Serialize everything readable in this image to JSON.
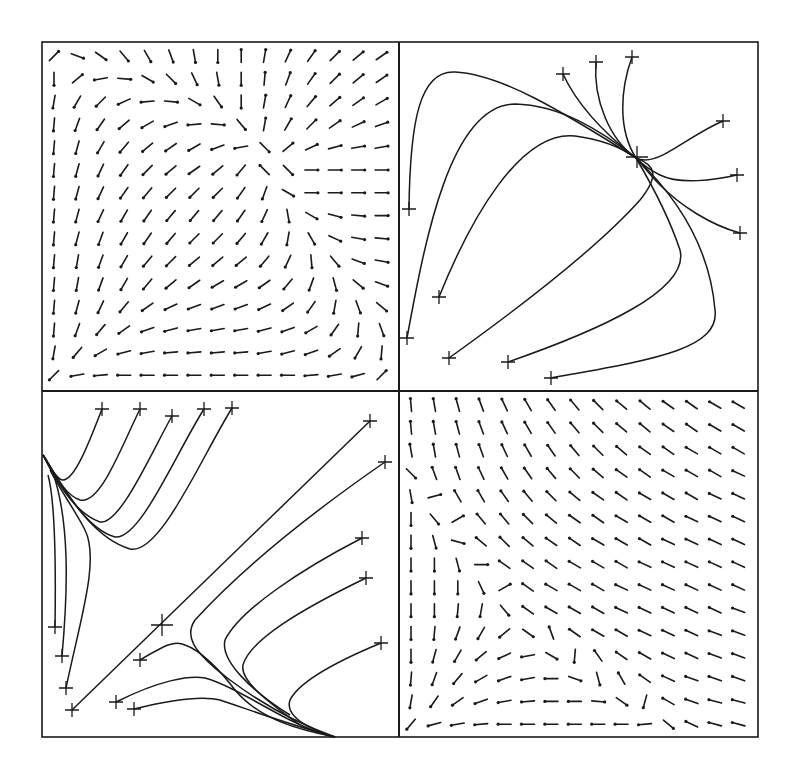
{
  "figure": {
    "frame": {
      "x0": 42,
      "y0": 42,
      "x1": 758,
      "y1": 737,
      "xmid": 399,
      "ymid": 391
    },
    "stroke_color": "#1a1a1a",
    "background": "#ffffff"
  },
  "panels": [
    {
      "id": "top-left",
      "kind": "direction-field",
      "origin": [
        54,
        56
      ],
      "spacing": [
        23.4,
        22.8
      ],
      "glyph_length": 13,
      "angles": [
        [
          -45,
          20,
          35,
          50,
          60,
          70,
          80,
          90,
          -90,
          -80,
          -65,
          -55,
          -45,
          -40,
          -35
        ],
        [
          90,
          -40,
          170,
          5,
          30,
          45,
          65,
          80,
          90,
          -85,
          -70,
          -55,
          -45,
          -40,
          -35
        ],
        [
          100,
          120,
          135,
          155,
          175,
          5,
          30,
          55,
          90,
          -80,
          -65,
          -50,
          -40,
          -35,
          -30
        ],
        [
          95,
          110,
          125,
          140,
          150,
          160,
          175,
          5,
          50,
          -80,
          -60,
          -45,
          -35,
          -25,
          -20
        ],
        [
          95,
          105,
          120,
          130,
          140,
          145,
          150,
          160,
          170,
          45,
          -40,
          -25,
          -15,
          -10,
          -10
        ],
        [
          95,
          105,
          115,
          125,
          135,
          140,
          145,
          140,
          130,
          -135,
          45,
          0,
          0,
          0,
          0
        ],
        [
          95,
          105,
          115,
          125,
          130,
          135,
          135,
          135,
          125,
          110,
          30,
          0,
          0,
          0,
          0
        ],
        [
          95,
          105,
          115,
          120,
          125,
          130,
          130,
          130,
          125,
          115,
          80,
          30,
          15,
          5,
          0
        ],
        [
          95,
          105,
          110,
          120,
          125,
          130,
          135,
          135,
          130,
          120,
          100,
          60,
          25,
          10,
          5
        ],
        [
          95,
          100,
          110,
          120,
          130,
          135,
          140,
          140,
          140,
          130,
          115,
          85,
          50,
          20,
          10
        ],
        [
          95,
          100,
          110,
          120,
          130,
          140,
          145,
          150,
          150,
          145,
          130,
          110,
          75,
          40,
          20
        ],
        [
          95,
          105,
          115,
          130,
          145,
          155,
          160,
          160,
          160,
          155,
          145,
          125,
          100,
          70,
          40
        ],
        [
          95,
          110,
          130,
          145,
          160,
          165,
          170,
          170,
          170,
          165,
          160,
          150,
          125,
          95,
          70
        ],
        [
          100,
          130,
          150,
          165,
          170,
          175,
          175,
          175,
          175,
          170,
          165,
          160,
          145,
          120,
          95
        ],
        [
          135,
          170,
          175,
          180,
          180,
          180,
          180,
          180,
          180,
          180,
          180,
          175,
          170,
          165,
          -45
        ]
      ]
    },
    {
      "id": "top-right",
      "kind": "trajectories",
      "curves": [
        "M409,209 C410,120 420,70 455,72 C500,74 560,110 636,158",
        "M407,338 C425,240 450,105 515,104 C560,105 600,130 636,158",
        "M439,297 C470,220 520,130 575,136 C605,140 625,150 636,158",
        "M449,358 C530,300 600,245 640,200 C660,175 655,165 636,158",
        "M508,362 C600,330 690,290 680,250 C670,220 655,190 636,158",
        "M551,378 C650,360 720,350 715,310 C710,250 680,200 636,158",
        "M563,74 C575,100 600,130 636,158",
        "M596,62 C593,100 610,140 636,158",
        "M632,57 C620,90 618,130 636,158",
        "M723,121 C690,135 665,160 645,160 C640,160 638,159 636,158",
        "M737,175 C715,180 680,185 660,175 C650,170 640,162 636,158",
        "M740,233 C710,225 680,205 660,185 C650,175 640,162 636,158"
      ],
      "markers": [
        [
          409,
          209
        ],
        [
          407,
          338
        ],
        [
          439,
          297
        ],
        [
          449,
          358
        ],
        [
          508,
          362
        ],
        [
          551,
          378
        ],
        [
          563,
          74
        ],
        [
          596,
          62
        ],
        [
          632,
          57
        ],
        [
          723,
          121
        ],
        [
          737,
          175
        ],
        [
          740,
          233
        ]
      ],
      "big_marker": [
        637,
        157
      ]
    },
    {
      "id": "bottom-left",
      "kind": "trajectories",
      "curves": [
        "M102,409 C90,440 75,480 63,480 C55,480 48,460 43,455",
        "M140,409 C120,450 100,505 80,500 C65,495 55,475 43,455",
        "M172,416 C150,455 120,525 100,522 C80,515 60,490 43,455",
        "M204,409 C175,455 140,540 115,537 C90,530 70,500 43,455",
        "M232,408 C200,460 160,555 130,549 C100,540 75,510 43,455",
        "M55,627 C56,560 55,500 48,475",
        "M62,656 C68,590 70,520 52,470",
        "M66,688 C80,620 100,560 85,530 C75,510 60,490 50,470",
        "M72,710 L370,421",
        "M140,660 C165,645 175,640 185,645 C200,650 220,670 235,690 C260,720 300,730 335,737",
        "M116,702 C160,680 190,675 205,678 C230,685 260,705 290,720 C310,730 325,735 335,737",
        "M134,709 C170,700 200,695 220,700 C250,710 290,725 335,737",
        "M385,462 C330,500 250,560 195,620 C185,635 190,650 230,680 C270,710 310,728 335,737",
        "M362,538 C300,570 240,610 225,640 C220,660 250,690 290,715",
        "M366,578 C300,610 250,640 243,665 C240,680 265,700 300,725",
        "M381,643 C340,660 300,680 290,700 C285,715 305,728 335,737"
      ],
      "markers": [
        [
          102,
          409
        ],
        [
          140,
          409
        ],
        [
          172,
          416
        ],
        [
          204,
          409
        ],
        [
          232,
          408
        ],
        [
          370,
          421
        ],
        [
          385,
          462
        ],
        [
          362,
          538
        ],
        [
          366,
          578
        ],
        [
          381,
          643
        ],
        [
          55,
          627
        ],
        [
          62,
          656
        ],
        [
          66,
          688
        ],
        [
          72,
          710
        ],
        [
          140,
          660
        ],
        [
          116,
          702
        ],
        [
          134,
          709
        ]
      ],
      "big_marker": [
        162,
        625
      ]
    },
    {
      "id": "bottom-right",
      "kind": "direction-field",
      "origin": [
        411,
        405
      ],
      "spacing": [
        23.4,
        22.8
      ],
      "glyph_length": 13,
      "angles": [
        [
          -95,
          -100,
          -105,
          -110,
          -115,
          -120,
          -125,
          -130,
          -135,
          -140,
          -140,
          -145,
          -145,
          -150,
          -150
        ],
        [
          -95,
          -100,
          -105,
          -110,
          -115,
          -120,
          -125,
          -130,
          -135,
          -140,
          -140,
          -145,
          -145,
          -150,
          -150
        ],
        [
          -100,
          -100,
          -105,
          -110,
          -115,
          -120,
          -125,
          -130,
          -135,
          -140,
          -145,
          -145,
          -150,
          -150,
          -150
        ],
        [
          45,
          -110,
          -110,
          -115,
          -120,
          -125,
          -130,
          -135,
          -140,
          -145,
          -145,
          -150,
          -150,
          -150,
          -155
        ],
        [
          80,
          -15,
          -120,
          -120,
          -125,
          -130,
          -135,
          -140,
          -145,
          -145,
          -150,
          -150,
          -150,
          -155,
          -155
        ],
        [
          90,
          50,
          -30,
          -130,
          -130,
          -135,
          -140,
          -145,
          -145,
          -150,
          -150,
          -150,
          -155,
          -155,
          -155
        ],
        [
          90,
          75,
          15,
          -140,
          -135,
          -140,
          -145,
          -145,
          -150,
          -150,
          -150,
          -155,
          -155,
          -155,
          -155
        ],
        [
          90,
          90,
          75,
          0,
          -145,
          -145,
          -145,
          -150,
          -150,
          -150,
          -155,
          -155,
          -155,
          -155,
          -155
        ],
        [
          90,
          90,
          90,
          65,
          -30,
          -145,
          -150,
          -150,
          -150,
          -155,
          -155,
          -155,
          -155,
          -155,
          -155
        ],
        [
          90,
          90,
          95,
          100,
          50,
          -145,
          -150,
          -150,
          -150,
          -155,
          -155,
          -155,
          -155,
          -155,
          -160
        ],
        [
          90,
          95,
          110,
          120,
          140,
          35,
          -110,
          -145,
          -150,
          -150,
          -155,
          -155,
          -155,
          -160,
          -160
        ],
        [
          90,
          105,
          120,
          140,
          155,
          170,
          30,
          95,
          -125,
          -145,
          -150,
          -155,
          -155,
          -160,
          -160
        ],
        [
          95,
          110,
          130,
          150,
          160,
          170,
          180,
          20,
          75,
          -120,
          -145,
          -155,
          -160,
          -160,
          -160
        ],
        [
          100,
          125,
          145,
          160,
          170,
          175,
          180,
          180,
          5,
          35,
          105,
          -150,
          -160,
          -165,
          -165
        ],
        [
          130,
          165,
          170,
          175,
          180,
          180,
          180,
          180,
          180,
          180,
          175,
          40,
          -155,
          -165,
          -165
        ]
      ]
    }
  ]
}
